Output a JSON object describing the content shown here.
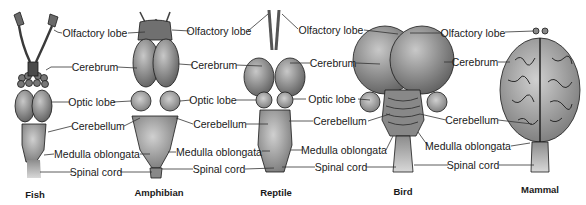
{
  "figure": {
    "animals": [
      {
        "name": "Fish",
        "x": 22,
        "y": 188
      },
      {
        "name": "Amphibian",
        "x": 162,
        "y": 186
      },
      {
        "name": "Reptile",
        "x": 270,
        "y": 186
      },
      {
        "name": "Bird",
        "x": 403,
        "y": 186
      },
      {
        "name": "Mammal",
        "x": 532,
        "y": 183
      }
    ],
    "label_columns": [
      {
        "between": "Fish-Amphibian",
        "labels": [
          {
            "text": "Olfactory lobe",
            "x": 95,
            "y": 33
          },
          {
            "text": "Cerebrum",
            "x": 95,
            "y": 67
          },
          {
            "text": "Optic lobe",
            "x": 92,
            "y": 102
          },
          {
            "text": "Cerebellum",
            "x": 98,
            "y": 126
          },
          {
            "text": "Medulla oblongata",
            "x": 97,
            "y": 154
          },
          {
            "text": "Spinal cord",
            "x": 96,
            "y": 172
          }
        ]
      },
      {
        "between": "Amphibian-Reptile",
        "labels": [
          {
            "text": "Olfactory lobe",
            "x": 219,
            "y": 31
          },
          {
            "text": "Cerebrum",
            "x": 214,
            "y": 65
          },
          {
            "text": "Optic lobe",
            "x": 213,
            "y": 100
          },
          {
            "text": "Cerebellum",
            "x": 220,
            "y": 124
          },
          {
            "text": "Medulla oblongata",
            "x": 219,
            "y": 152
          },
          {
            "text": "Spinal cord",
            "x": 219,
            "y": 169
          }
        ]
      },
      {
        "between": "Reptile-Bird",
        "labels": [
          {
            "text": "Olfactory lobe",
            "x": 331,
            "y": 30
          },
          {
            "text": "Cerebrum",
            "x": 333,
            "y": 63
          },
          {
            "text": "Optic lobe",
            "x": 332,
            "y": 99
          },
          {
            "text": "Cerebellum",
            "x": 340,
            "y": 121
          },
          {
            "text": "Medulla oblongata",
            "x": 344,
            "y": 150
          },
          {
            "text": "Spinal cord",
            "x": 341,
            "y": 167
          }
        ]
      },
      {
        "between": "Bird-Mammal",
        "labels": [
          {
            "text": "Olfactory lobe",
            "x": 473,
            "y": 33
          },
          {
            "text": "Cerebrum",
            "x": 475,
            "y": 62
          },
          {
            "text": "Cerebellum",
            "x": 472,
            "y": 120
          },
          {
            "text": "Medulla oblongata",
            "x": 468,
            "y": 146
          },
          {
            "text": "Spinal cord",
            "x": 473,
            "y": 165
          }
        ]
      }
    ],
    "colors": {
      "ink": "#1a1a1a",
      "fill": "#8a8a8a",
      "fill_dark": "#5a5a5a",
      "fill_light": "#b5b5b5",
      "leader": "#333333"
    }
  }
}
